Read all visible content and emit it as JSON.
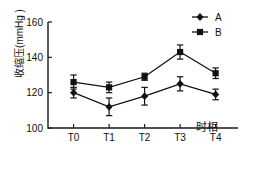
{
  "chart_data": {
    "type": "line",
    "title": "",
    "xlabel": "时相",
    "ylabel": "收缩压(mmHg )",
    "categories": [
      "T0",
      "T1",
      "T2",
      "T3",
      "T4"
    ],
    "ylim": [
      100,
      160
    ],
    "ytick_labels": [
      "100",
      "120",
      "140",
      "160"
    ],
    "ytick_values": [
      100,
      120,
      140,
      160
    ],
    "grid": false,
    "legend_position": "top-right",
    "series": [
      {
        "name": "A",
        "marker": "diamond",
        "values": [
          120,
          112,
          118,
          125,
          119
        ],
        "errors": [
          3,
          5,
          5,
          4,
          3
        ]
      },
      {
        "name": "B",
        "marker": "square",
        "values": [
          126,
          123,
          129,
          143,
          131
        ],
        "errors": [
          4,
          3,
          2,
          4,
          3
        ]
      }
    ]
  },
  "legend": {
    "entries": [
      {
        "label": "A",
        "marker": "diamond"
      },
      {
        "label": "B",
        "marker": "square"
      }
    ]
  }
}
